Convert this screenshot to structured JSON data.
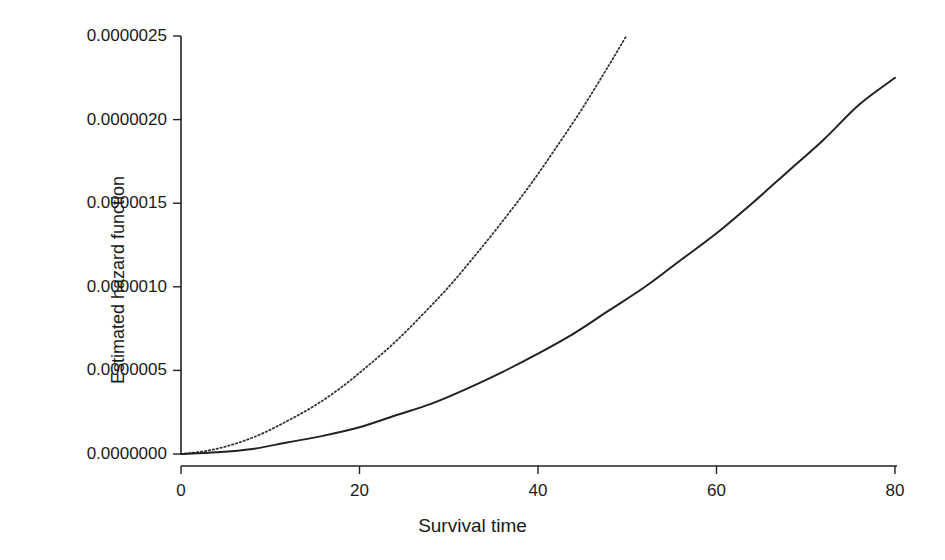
{
  "chart_data": {
    "type": "line",
    "title": "",
    "xlabel": "Survival time",
    "ylabel": "Estimated hazard function",
    "xlim": [
      0,
      80
    ],
    "ylim": [
      0.0,
      2.5e-06
    ],
    "grid": false,
    "legend": "none",
    "xticks": [
      0,
      20,
      40,
      60,
      80
    ],
    "xtick_labels": [
      "0",
      "20",
      "40",
      "60",
      "80"
    ],
    "yticks": [
      0.0,
      5e-07,
      1e-06,
      1.5e-06,
      2e-06,
      2.5e-06
    ],
    "ytick_labels": [
      "0.0000000",
      "0.0000005",
      "0.0000010",
      "0.0000015",
      "0.0000020",
      "0.0000025"
    ],
    "series": [
      {
        "name": "solid-curve",
        "style": "solid",
        "color": "#222222",
        "x": [
          0,
          4,
          8,
          12,
          16,
          20,
          24,
          28,
          32,
          36,
          40,
          44,
          48,
          52,
          56,
          60,
          64,
          68,
          72,
          76,
          80
        ],
        "y": [
          0.0,
          1e-08,
          3e-08,
          7e-08,
          1.1e-07,
          1.6e-07,
          2.3e-07,
          3e-07,
          3.9e-07,
          4.9e-07,
          6e-07,
          7.2e-07,
          8.6e-07,
          1e-06,
          1.16e-06,
          1.32e-06,
          1.5e-06,
          1.69e-06,
          1.88e-06,
          2.09e-06,
          2.25e-06
        ]
      },
      {
        "name": "dotted-curve",
        "style": "dotted",
        "color": "#333333",
        "x": [
          0,
          3,
          6,
          9,
          12,
          15,
          18,
          21,
          24,
          27,
          30,
          33,
          36,
          39,
          42,
          45,
          48,
          51,
          54,
          57,
          60
        ],
        "y": [
          0.0,
          2e-08,
          6e-08,
          1.2e-07,
          2e-07,
          2.9e-07,
          4e-07,
          5.3e-07,
          6.7e-07,
          8.3e-07,
          1e-06,
          1.19e-06,
          1.39e-06,
          1.6e-06,
          1.83e-06,
          2.07e-06,
          2.33e-06,
          2.6e-06,
          2.88e-06,
          3.17e-06,
          3.48e-06
        ],
        "x_end_visible": 60,
        "y_end_visible": 2.5e-06
      }
    ]
  },
  "axes": {
    "x_title": "Survival time",
    "y_title": "Estimated hazard function"
  }
}
